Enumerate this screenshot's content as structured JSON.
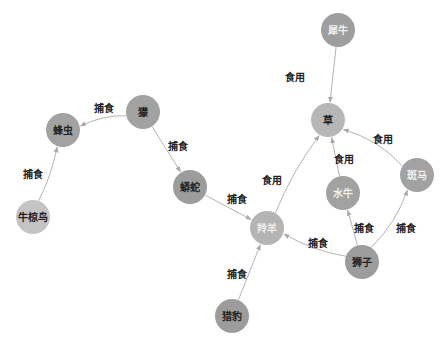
{
  "graph": {
    "type": "food-web",
    "nodes": [
      {
        "id": "rhino",
        "label": "犀牛",
        "x": 338,
        "y": 30,
        "fill": "#9e9e9e",
        "text": "#f0f0f0"
      },
      {
        "id": "grass",
        "label": "草",
        "x": 328,
        "y": 120,
        "fill": "#b6b6b6",
        "text": "#222222"
      },
      {
        "id": "zebra",
        "label": "斑马",
        "x": 417,
        "y": 175,
        "fill": "#a2a2a2",
        "text": "#f0f0f0"
      },
      {
        "id": "buffalo",
        "label": "水牛",
        "x": 343,
        "y": 193,
        "fill": "#a2a2a2",
        "text": "#f0f0f0"
      },
      {
        "id": "antelope",
        "label": "羚羊",
        "x": 267,
        "y": 228,
        "fill": "#b4b4b4",
        "text": "#f0f0f0"
      },
      {
        "id": "lion",
        "label": "狮子",
        "x": 362,
        "y": 262,
        "fill": "#9c9c9c",
        "text": "#222222"
      },
      {
        "id": "cheetah",
        "label": "猎豹",
        "x": 232,
        "y": 316,
        "fill": "#9c9c9c",
        "text": "#222222"
      },
      {
        "id": "python",
        "label": "蟒蛇",
        "x": 190,
        "y": 187,
        "fill": "#9c9c9c",
        "text": "#222222"
      },
      {
        "id": "mongoose",
        "label": "獴",
        "x": 143,
        "y": 112,
        "fill": "#a2a2a2",
        "text": "#222222"
      },
      {
        "id": "beeeater",
        "label": "蜂虫",
        "x": 63,
        "y": 130,
        "fill": "#a2a2a2",
        "text": "#222222"
      },
      {
        "id": "oxpecker",
        "label": "牛椋鸟",
        "x": 33,
        "y": 217,
        "fill": "#c4c4c4",
        "text": "#222222"
      }
    ],
    "edges": [
      {
        "from": "rhino",
        "to": "grass",
        "label": "食用",
        "lx": 295,
        "ly": 78,
        "curve": 0
      },
      {
        "from": "zebra",
        "to": "grass",
        "label": "食用",
        "lx": 383,
        "ly": 140,
        "curve": 10
      },
      {
        "from": "buffalo",
        "to": "grass",
        "label": "食用",
        "lx": 344,
        "ly": 160,
        "curve": 0
      },
      {
        "from": "antelope",
        "to": "grass",
        "label": "食用",
        "lx": 272,
        "ly": 181,
        "curve": -6
      },
      {
        "from": "lion",
        "to": "buffalo",
        "label": "捕食",
        "lx": 364,
        "ly": 229,
        "curve": 0
      },
      {
        "from": "lion",
        "to": "zebra",
        "label": "捕食",
        "lx": 406,
        "ly": 229,
        "curve": 8
      },
      {
        "from": "lion",
        "to": "antelope",
        "label": "捕食",
        "lx": 318,
        "ly": 244,
        "curve": -6
      },
      {
        "from": "python",
        "to": "antelope",
        "label": "捕食",
        "lx": 237,
        "ly": 200,
        "curve": 0
      },
      {
        "from": "cheetah",
        "to": "antelope",
        "label": "捕食",
        "lx": 237,
        "ly": 275,
        "curve": 0
      },
      {
        "from": "mongoose",
        "to": "beeeater",
        "label": "捕食",
        "lx": 104,
        "ly": 109,
        "curve": 6
      },
      {
        "from": "mongoose",
        "to": "python",
        "label": "捕食",
        "lx": 178,
        "ly": 147,
        "curve": 0
      },
      {
        "from": "oxpecker",
        "to": "beeeater",
        "label": "捕食",
        "lx": 33,
        "ly": 175,
        "curve": 4
      }
    ],
    "node_radius": 17,
    "edge_color": "#b4b4b4"
  }
}
